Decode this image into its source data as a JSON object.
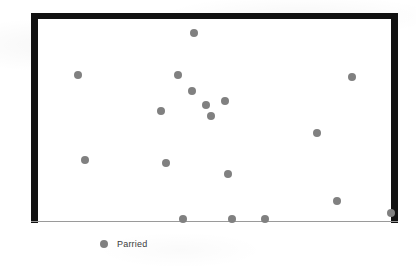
{
  "chart_data": {
    "type": "scatter",
    "title": "",
    "xlabel": "",
    "ylabel": "",
    "grid": false,
    "legend_position": "bottom-left",
    "axis": {
      "x_ticks": [],
      "y_ticks": [],
      "xlim": [
        0,
        100
      ],
      "ylim": [
        0,
        100
      ]
    },
    "series": [
      {
        "name": "Parried",
        "color": "#808080",
        "marker": "circle",
        "points": [
          {
            "x": 44.2,
            "y": 93.1
          },
          {
            "x": 11.3,
            "y": 72.4
          },
          {
            "x": 39.7,
            "y": 72.4
          },
          {
            "x": 88.9,
            "y": 71.4
          },
          {
            "x": 43.6,
            "y": 64.5
          },
          {
            "x": 47.6,
            "y": 57.6
          },
          {
            "x": 53.0,
            "y": 59.6
          },
          {
            "x": 34.8,
            "y": 54.7
          },
          {
            "x": 49.0,
            "y": 52.2
          },
          {
            "x": 79.0,
            "y": 43.8
          },
          {
            "x": 13.3,
            "y": 30.5
          },
          {
            "x": 36.3,
            "y": 29.1
          },
          {
            "x": 53.8,
            "y": 23.6
          },
          {
            "x": 84.7,
            "y": 10.3
          },
          {
            "x": 41.0,
            "y": 1.5
          },
          {
            "x": 55.0,
            "y": 1.5
          },
          {
            "x": 64.3,
            "y": 1.5
          },
          {
            "x": 100.0,
            "y": 4.4
          }
        ]
      }
    ]
  },
  "legend": {
    "entries": [
      {
        "label": "Parried",
        "marker": "circle-marker",
        "color": "#808080"
      }
    ]
  },
  "colors": {
    "point": "#808080",
    "frame": "#111111",
    "baseline": "#9a9a9a",
    "background": "#ffffff"
  }
}
